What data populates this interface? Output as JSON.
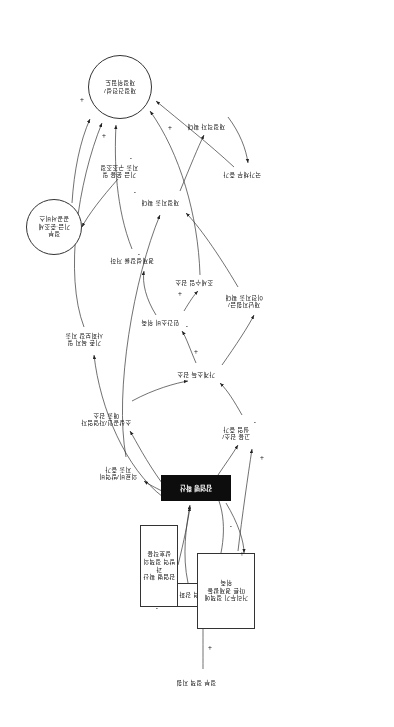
{
  "diagram": {
    "type": "causal-loop-diagram",
    "orientation_note": "180도 회전",
    "nodes": [
      {
        "id": "n_outbreak",
        "label": "감염병 확산",
        "shape": "black-box",
        "x": 163,
        "y": 226,
        "w": 68,
        "h": 24
      },
      {
        "id": "n_quarantine",
        "label": "방역 강화",
        "shape": "box",
        "x": 175,
        "y": 120,
        "w": 52,
        "h": 22
      },
      {
        "id": "n_support",
        "label": "정부 정책 지원",
        "shape": "label",
        "x": 163,
        "y": 40,
        "w": 70,
        "h": 18
      },
      {
        "id": "n_distance",
        "label": "거리두기 정책에\n따른 경제활동\n위축",
        "shape": "box",
        "x": 139,
        "y": 98,
        "w": 56,
        "h": 74
      },
      {
        "id": "n_medcost",
        "label": "의료비/방역비\n지출 증가",
        "shape": "label",
        "x": 246,
        "y": 246,
        "w": 60,
        "h": 24
      },
      {
        "id": "n_biz",
        "label": "소상공인/자영업자\n매출 감소",
        "shape": "label",
        "x": 256,
        "y": 300,
        "w": 64,
        "h": 24
      },
      {
        "id": "n_employ",
        "label": "고용 감소/\n실업 증가",
        "shape": "label",
        "x": 130,
        "y": 286,
        "w": 56,
        "h": 24
      },
      {
        "id": "n_income",
        "label": "가계소득 감소",
        "shape": "label",
        "x": 170,
        "y": 348,
        "w": 56,
        "h": 16
      },
      {
        "id": "n_consume",
        "label": "민간소비 위축",
        "shape": "label",
        "x": 206,
        "y": 400,
        "w": 56,
        "h": 16
      },
      {
        "id": "n_tax",
        "label": "조세수입 감소",
        "shape": "label",
        "x": 172,
        "y": 440,
        "w": 56,
        "h": 16
      },
      {
        "id": "n_transfer",
        "label": "재난지원금/\n이전지출 확대",
        "shape": "label",
        "x": 120,
        "y": 418,
        "w": 60,
        "h": 24
      },
      {
        "id": "n_growth",
        "label": "경제성장률 저하",
        "shape": "label",
        "x": 232,
        "y": 462,
        "w": 60,
        "h": 16
      },
      {
        "id": "n_budget",
        "label": "재정지출 확대",
        "shape": "label",
        "x": 206,
        "y": 520,
        "w": 56,
        "h": 16
      },
      {
        "id": "n_debt",
        "label": "국가채무 증가",
        "shape": "label",
        "x": 124,
        "y": 548,
        "w": 56,
        "h": 16
      },
      {
        "id": "n_deficit",
        "label": "재정적자 확대",
        "shape": "label",
        "x": 160,
        "y": 596,
        "w": 56,
        "h": 16
      },
      {
        "id": "n_fiscal",
        "label": "재정건전성/\n재정위험도",
        "shape": "circle",
        "x": 242,
        "y": 608,
        "w": 62,
        "h": 62
      },
      {
        "id": "n_fund",
        "label": "정부\n기금·준조세\n공공서비스",
        "shape": "circle",
        "x": 312,
        "y": 472,
        "w": 54,
        "h": 54
      },
      {
        "id": "n_policy",
        "label": "기금 운용 및\n지출 구조조정",
        "shape": "label",
        "x": 244,
        "y": 548,
        "w": 62,
        "h": 24
      },
      {
        "id": "n_welfare",
        "label": "기존 복지 및\n사회보장 지출",
        "shape": "label",
        "x": 280,
        "y": 380,
        "w": 60,
        "h": 24
      },
      {
        "id": "n_boxnote",
        "label": "감염병 확산과\n방역 정책의\n상호작용",
        "shape": "box",
        "x": 216,
        "y": 120,
        "w": 36,
        "h": 80
      }
    ],
    "edges": [
      {
        "from": "n_support",
        "to": "n_quarantine",
        "sign": ""
      },
      {
        "from": "n_quarantine",
        "to": "n_outbreak",
        "sign": "-"
      },
      {
        "from": "n_outbreak",
        "to": "n_quarantine",
        "sign": "+"
      },
      {
        "from": "n_outbreak",
        "to": "n_distance",
        "sign": "+"
      },
      {
        "from": "n_outbreak",
        "to": "n_medcost",
        "sign": "+"
      },
      {
        "from": "n_outbreak",
        "to": "n_biz",
        "sign": "-"
      },
      {
        "from": "n_distance",
        "to": "n_employ",
        "sign": "-"
      },
      {
        "from": "n_employ",
        "to": "n_income",
        "sign": "-"
      },
      {
        "from": "n_income",
        "to": "n_consume",
        "sign": "+"
      },
      {
        "from": "n_consume",
        "to": "n_growth",
        "sign": "-"
      },
      {
        "from": "n_consume",
        "to": "n_tax",
        "sign": "+"
      },
      {
        "from": "n_tax",
        "to": "n_fiscal",
        "sign": "-"
      },
      {
        "from": "n_income",
        "to": "n_transfer",
        "sign": "-"
      },
      {
        "from": "n_transfer",
        "to": "n_budget",
        "sign": "+"
      },
      {
        "from": "n_medcost",
        "to": "n_budget",
        "sign": "+"
      },
      {
        "from": "n_budget",
        "to": "n_deficit",
        "sign": "+"
      },
      {
        "from": "n_deficit",
        "to": "n_debt",
        "sign": "+"
      },
      {
        "from": "n_debt",
        "to": "n_fiscal",
        "sign": "-"
      },
      {
        "from": "n_growth",
        "to": "n_fiscal",
        "sign": "+"
      },
      {
        "from": "n_welfare",
        "to": "n_fiscal",
        "sign": "+"
      },
      {
        "from": "n_fund",
        "to": "n_fiscal",
        "sign": "+"
      },
      {
        "from": "n_policy",
        "to": "n_fund",
        "sign": "+"
      }
    ],
    "sign_markers": [
      {
        "label": "+",
        "x": 182,
        "y": 76
      },
      {
        "label": "-",
        "x": 236,
        "y": 114
      },
      {
        "label": "+",
        "x": 150,
        "y": 170
      },
      {
        "label": "-",
        "x": 162,
        "y": 196
      },
      {
        "label": "+",
        "x": 130,
        "y": 266
      },
      {
        "label": "-",
        "x": 138,
        "y": 300
      },
      {
        "label": "+",
        "x": 196,
        "y": 372
      },
      {
        "label": "-",
        "x": 206,
        "y": 396
      },
      {
        "label": "+",
        "x": 212,
        "y": 430
      },
      {
        "label": "-",
        "x": 254,
        "y": 468
      },
      {
        "label": "-",
        "x": 258,
        "y": 530
      },
      {
        "label": "-",
        "x": 262,
        "y": 564
      },
      {
        "label": "+",
        "x": 288,
        "y": 588
      },
      {
        "label": "+",
        "x": 222,
        "y": 596
      },
      {
        "label": "+",
        "x": 310,
        "y": 624
      }
    ]
  }
}
